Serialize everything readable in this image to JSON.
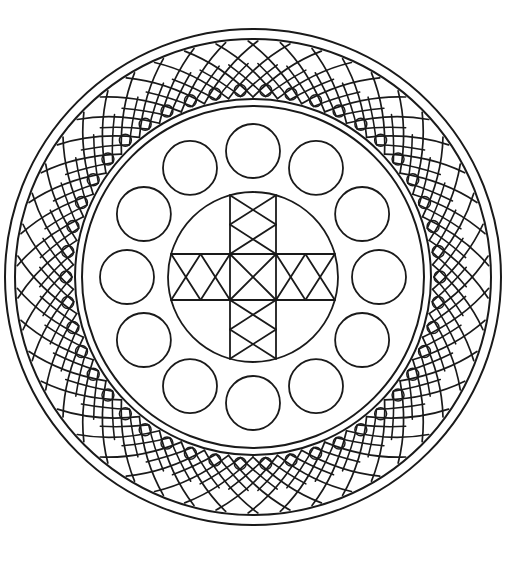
{
  "artwork": {
    "title": "Circular Mandala Coloring Page",
    "kind": "line-art-mandala",
    "alt_text": "Black and white circular mandala line drawing with a woven lattice outer border, twelve small circles in a middle ring, and a central cross medallion",
    "background_color": "#ffffff",
    "stroke_color": "#1a1a1a",
    "canvas": {
      "width": 526,
      "height": 564
    },
    "center": {
      "x": 253,
      "y": 277
    }
  },
  "geometry": {
    "outer_rim": {
      "name": "outer-rim-rings",
      "radii": [
        248,
        238
      ],
      "stroke_width": 2.0
    },
    "lattice_band": {
      "name": "woven-lattice-band",
      "outer_radius": 236,
      "inner_radius": 180,
      "segments": 46,
      "stroke_width": 1.7,
      "bulge": 22,
      "scallop_radius": 6,
      "scallop_inset": 7
    },
    "inner_rim": {
      "name": "inner-rim-rings",
      "radii": [
        178,
        171
      ],
      "stroke_width": 2.0
    },
    "satellite_circles": {
      "name": "satellite-circle-ring",
      "count": 12,
      "orbit_radius": 126,
      "circle_radius": 27,
      "start_angle_deg": -90,
      "stroke_width": 1.8
    },
    "center_medallion": {
      "name": "center-medallion",
      "circle_radius": 85,
      "band_half_width": 23,
      "stroke_width": 1.8,
      "arms": 4,
      "arm_cross_count": 2,
      "hub_cross": true
    }
  },
  "labels": {
    "outer_rim": "Outer rim",
    "lattice": "Woven lattice border",
    "inner_rim": "Inner rim",
    "satellites": "Ring of twelve circles",
    "center": "Central cross medallion"
  },
  "chart_data": {
    "type": "diagram",
    "title": "Circular Mandala Coloring Page",
    "rings": [
      {
        "name": "Outer rim",
        "radius": 248,
        "elements": 1
      },
      {
        "name": "Outer rim inner",
        "radius": 238,
        "elements": 1
      },
      {
        "name": "Woven lattice band",
        "radius_outer": 236,
        "radius_inner": 180,
        "elements": 46
      },
      {
        "name": "Inner rim",
        "radius": 178,
        "elements": 1
      },
      {
        "name": "Inner rim inner",
        "radius": 171,
        "elements": 1
      },
      {
        "name": "Satellite circles",
        "radius": 126,
        "elements": 12,
        "element_radius": 27
      },
      {
        "name": "Center medallion",
        "radius": 85,
        "elements": 1
      }
    ]
  }
}
